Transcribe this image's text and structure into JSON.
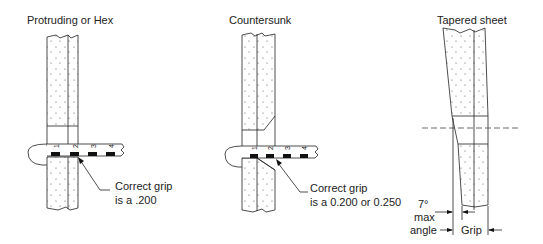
{
  "panels": [
    {
      "title": "Protruding or Hex",
      "note_line1": "Correct grip",
      "note_line2": "is a .200",
      "gauge_marks": [
        "1",
        "2",
        "3",
        "4"
      ]
    },
    {
      "title": "Countersunk",
      "note_line1": "Correct grip",
      "note_line2": "is a 0.200 or 0.250",
      "gauge_marks": [
        "1",
        "2",
        "3",
        "4"
      ]
    },
    {
      "title": "Tapered sheet",
      "angle_line1": "7°",
      "angle_line2": "max",
      "angle_line3": "angle",
      "grip_label": "Grip"
    }
  ],
  "colors": {
    "ink": "#222222",
    "background": "#ffffff",
    "stipple": "#555555"
  }
}
